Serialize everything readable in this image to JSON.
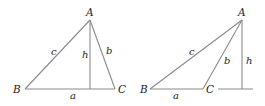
{
  "figures": [
    {
      "name": "acute-triangle",
      "vertices": {
        "A": {
          "label": "A",
          "x": 90,
          "y": 20
        },
        "B": {
          "label": "B",
          "x": 25,
          "y": 89
        },
        "C": {
          "label": "C",
          "x": 115,
          "y": 89
        }
      },
      "altitude_foot": {
        "x": 90,
        "y": 89
      },
      "labels": {
        "a": {
          "text": "a",
          "x": 70,
          "y": 99
        },
        "b": {
          "text": "b",
          "x": 106,
          "y": 54
        },
        "c": {
          "text": "c",
          "x": 51,
          "y": 55
        },
        "h": {
          "text": "h",
          "x": 82,
          "y": 58
        }
      },
      "vertex_label_pos": {
        "A": {
          "x": 86,
          "y": 16
        },
        "B": {
          "x": 13,
          "y": 93
        },
        "C": {
          "x": 118,
          "y": 93
        }
      }
    },
    {
      "name": "obtuse-triangle",
      "vertices": {
        "A": {
          "label": "A",
          "x": 242,
          "y": 20
        },
        "B": {
          "label": "B",
          "x": 150,
          "y": 89
        },
        "C": {
          "label": "C",
          "x": 203,
          "y": 89
        }
      },
      "altitude_foot": {
        "x": 242,
        "y": 89
      },
      "base_extension": {
        "x1": 218,
        "x2": 253,
        "y": 89
      },
      "labels": {
        "a": {
          "text": "a",
          "x": 173,
          "y": 99
        },
        "b": {
          "text": "b",
          "x": 224,
          "y": 64
        },
        "c": {
          "text": "c",
          "x": 189,
          "y": 55
        },
        "h": {
          "text": "h",
          "x": 246,
          "y": 64
        }
      },
      "vertex_label_pos": {
        "A": {
          "x": 238,
          "y": 16
        },
        "B": {
          "x": 140,
          "y": 93
        },
        "C": {
          "x": 206,
          "y": 93
        }
      }
    }
  ],
  "colors": {
    "line": "#8a8a8a",
    "text": "#222222"
  }
}
